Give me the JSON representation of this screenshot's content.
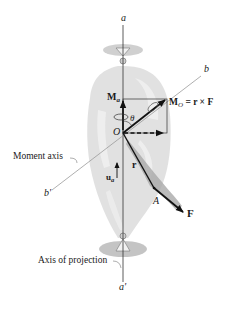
{
  "figure": {
    "colors": {
      "line": "#1a1a1a",
      "axis_thin": "#9a9a9a",
      "body_fill": "#d9d9d9",
      "body_light": "#ececec",
      "shadow": "#bdbdbd",
      "arrow": "#111111"
    }
  },
  "labels": {
    "axis_top": "a",
    "axis_bottom": "a'",
    "moment_axis_top": "b",
    "moment_axis_bottom": "b'",
    "moment_about_axis": "M",
    "moment_about_axis_sub": "a",
    "moment_about_point": "M",
    "moment_about_point_sub": "O",
    "moment_about_point_eq": " = r × F",
    "angle": "θ",
    "origin": "O",
    "position_vector": "r",
    "unit_vector": "u",
    "unit_vector_sub": "a",
    "point": "A",
    "force": "F",
    "moment_axis_caption": "Moment axis",
    "projection_axis_caption": "Axis of projection"
  }
}
